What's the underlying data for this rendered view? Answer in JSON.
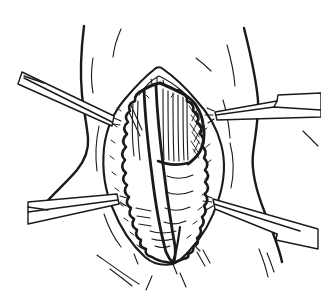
{
  "illustration": {
    "caption": "Line drawing of a surgical exposure of the anterior neck: a vertical midline incision is held open by four retractors, revealing scalloped subcutaneous fat edges, vertically striated strap muscles, a retracted midline muscle band, and deeper soft-tissue folds.",
    "background_color": "#ffffff",
    "ink_color": "#1a1a1a",
    "parts": {
      "neck_outline": "Neck outline",
      "incision": "Retracted midline incision",
      "fat_edges": "Scalloped subcutaneous fat edges",
      "strap_muscles": "Strap muscles with vertical fibers",
      "midline_band": "Retracted midline muscle band",
      "deep_layer": "Deep soft-tissue folds",
      "retractor_upper_left": "Retractor, upper left",
      "retractor_upper_right": "Retractor, upper right",
      "retractor_lower_left": "Retractor, lower left",
      "retractor_lower_right": "Retractor, lower right"
    }
  }
}
